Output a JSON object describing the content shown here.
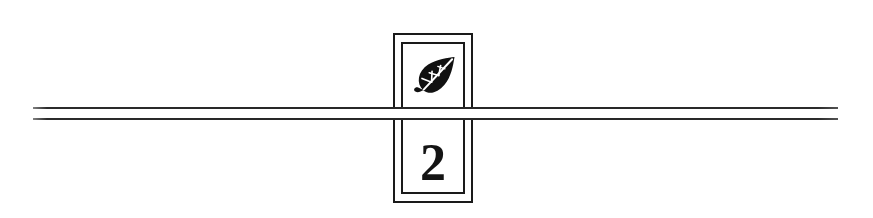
{
  "canvas": {
    "width": 873,
    "height": 218,
    "background_color": "#ffffff"
  },
  "plaque": {
    "border_color": "#1a1a1a",
    "emblem": {
      "icon_name": "leaf-icon",
      "description": "leaf",
      "color": "#111111"
    },
    "number": {
      "value": "2",
      "color": "#141414"
    }
  },
  "rules": {
    "color": "#262626",
    "top_label": "",
    "bottom_label": "",
    "gap_color": "#ffffff"
  }
}
